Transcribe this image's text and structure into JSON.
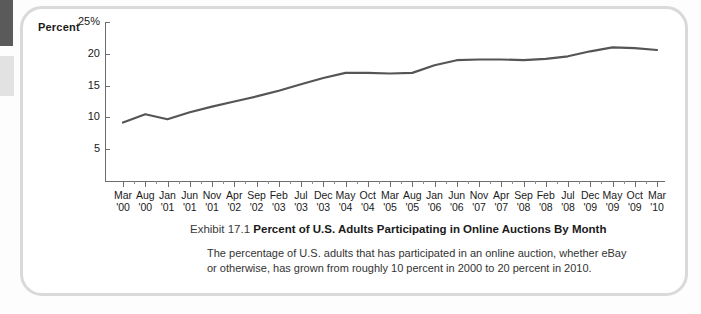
{
  "exhibit": {
    "number_label": "Exhibit 17.1",
    "title": "Percent of U.S. Adults Participating in Online Auctions By Month",
    "body": "The percentage of U.S. adults that has participated in an online auction, whether eBay or otherwise, has grown from roughly 10 percent in 2000 to 20 percent in 2010."
  },
  "chart_data": {
    "type": "line",
    "title": "Percent of U.S. Adults Participating in Online Auctions By Month",
    "xlabel": "",
    "ylabel": "Percent",
    "ylim": [
      0,
      25
    ],
    "yticks": [
      5,
      10,
      15,
      20,
      25
    ],
    "ytick_labels": [
      "5",
      "10",
      "15",
      "20",
      "25%"
    ],
    "grid": false,
    "legend": "none",
    "line_color": "#555555",
    "categories": [
      "Mar '00",
      "Aug '00",
      "Jan '01",
      "Jun '01",
      "Nov '01",
      "Apr '02",
      "Sep '02",
      "Feb '03",
      "Jul '03",
      "Dec '03",
      "May '04",
      "Oct '04",
      "Mar '05",
      "Aug '05",
      "Jan '06",
      "Jun '06",
      "Nov '06",
      "Apr '07",
      "Sep '07",
      "Feb '08",
      "Jul '08",
      "Dec '08",
      "May '09",
      "Oct '09",
      "Mar '10"
    ],
    "month_labels": [
      "Mar",
      "Aug",
      "Jan",
      "Jun",
      "Nov",
      "Apr",
      "Sep",
      "Feb",
      "Jul",
      "Dec",
      "May",
      "Oct",
      "Mar",
      "Aug",
      "Jan",
      "Jun",
      "Nov",
      "Apr",
      "Sep",
      "Feb",
      "Jul",
      "Dec",
      "May",
      "Oct",
      "Mar"
    ],
    "year_labels": [
      "'00",
      "'00",
      "'01",
      "'01",
      "'01",
      "'02",
      "'02",
      "'03",
      "'03",
      "'03",
      "'04",
      "'04",
      "'05",
      "'05",
      "'06",
      "'06",
      "'07",
      "'07",
      "'08",
      "'08",
      "'08",
      "'09",
      "'09",
      "'09",
      "'10"
    ],
    "values": [
      9.2,
      10.5,
      9.7,
      10.8,
      11.7,
      12.5,
      13.3,
      14.2,
      15.2,
      16.2,
      17.0,
      17.0,
      16.9,
      17.0,
      18.2,
      19.0,
      19.1,
      19.1,
      19.0,
      19.2,
      19.6,
      20.4,
      21.0,
      20.9,
      20.6
    ]
  }
}
